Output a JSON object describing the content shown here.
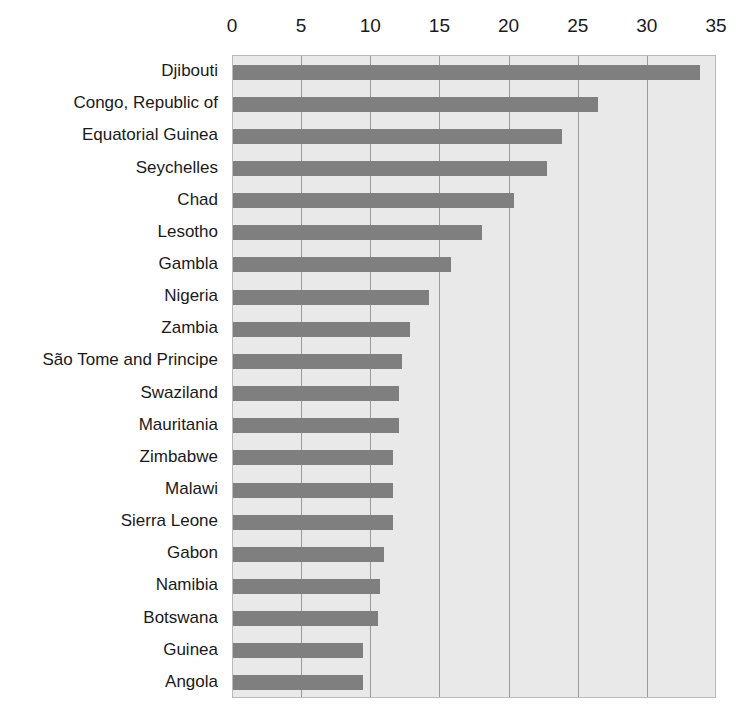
{
  "chart_data": {
    "type": "bar",
    "orientation": "horizontal",
    "title": "",
    "subtitle": "",
    "xlabel": "",
    "ylabel": "",
    "xlim": [
      0,
      35
    ],
    "ylim": null,
    "grid": true,
    "legend": null,
    "legend_position": "none",
    "xticks": [
      0,
      5,
      10,
      15,
      20,
      25,
      30,
      35
    ],
    "xtick_labels": [
      "0",
      "5",
      "10",
      "15",
      "20",
      "25",
      "30",
      "35"
    ],
    "categories": [
      "Djibouti",
      "Congo, Republic of",
      "Equatorial Guinea",
      "Seychelles",
      "Chad",
      "Lesotho",
      "Gambla",
      "Nigeria",
      "Zambia",
      "São Tome and Principe",
      "Swaziland",
      "Mauritania",
      "Zimbabwe",
      "Malawi",
      "Sierra Leone",
      "Gabon",
      "Namibia",
      "Botswana",
      "Guinea",
      "Angola"
    ],
    "values": [
      33.8,
      26.4,
      23.8,
      22.7,
      20.3,
      18.0,
      15.8,
      14.2,
      12.8,
      12.2,
      12.0,
      12.0,
      11.6,
      11.6,
      11.6,
      10.9,
      10.6,
      10.5,
      9.4,
      9.4
    ],
    "colors": {
      "bar": "#7f7f7f",
      "plot_background": "#e9e9e9",
      "gridline": "#9a9a9a",
      "plot_border": "#b9b9b9",
      "text": "#1a1a1a",
      "page_background": "#ffffff"
    }
  }
}
